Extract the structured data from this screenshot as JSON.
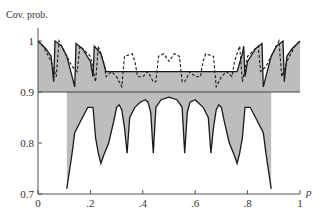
{
  "chart_data": {
    "type": "line",
    "title": "",
    "ylabel": "Cov. prob.",
    "xlabel": "p",
    "xlim": [
      0,
      1
    ],
    "ylim": [
      0.7,
      1.0
    ],
    "x_ticks": [
      {
        "value": 0,
        "label": "0"
      },
      {
        "value": 0.2,
        "label": ".2"
      },
      {
        "value": 0.4,
        "label": ".4"
      },
      {
        "value": 0.6,
        "label": ".6"
      },
      {
        "value": 0.8,
        "label": ".8"
      },
      {
        "value": 1.0,
        "label": "1"
      }
    ],
    "y_ticks": [
      {
        "value": 1.0,
        "label": "1"
      },
      {
        "value": 0.9,
        "label": "0.9"
      },
      {
        "value": 0.8,
        "label": "0.8"
      },
      {
        "value": 0.7,
        "label": "0.7"
      }
    ],
    "reference_line": 0.9,
    "grid": false,
    "legend": "none",
    "fill_color": "#bdbdbd",
    "line_color": "#1a1a1a",
    "series": [
      {
        "name": "dashed coverage curve",
        "style": "dashed",
        "points": [
          [
            0,
            1.0
          ],
          [
            0.02,
            0.99
          ],
          [
            0.05,
            0.96
          ],
          [
            0.07,
            0.93
          ],
          [
            0.08,
            1.0
          ],
          [
            0.1,
            0.98
          ],
          [
            0.13,
            0.95
          ],
          [
            0.15,
            0.94
          ],
          [
            0.16,
            0.99
          ],
          [
            0.2,
            0.97
          ],
          [
            0.22,
            0.92
          ],
          [
            0.23,
            0.99
          ],
          [
            0.25,
            0.96
          ],
          [
            0.26,
            0.93
          ],
          [
            0.28,
            0.94
          ],
          [
            0.3,
            0.93
          ],
          [
            0.32,
            0.91
          ],
          [
            0.33,
            0.97
          ],
          [
            0.36,
            0.975
          ],
          [
            0.37,
            0.96
          ],
          [
            0.38,
            0.93
          ],
          [
            0.4,
            0.93
          ],
          [
            0.42,
            0.94
          ],
          [
            0.44,
            0.92
          ],
          [
            0.45,
            0.92
          ],
          [
            0.46,
            0.97
          ],
          [
            0.48,
            0.975
          ],
          [
            0.5,
            0.96
          ],
          [
            0.52,
            0.975
          ],
          [
            0.54,
            0.97
          ],
          [
            0.55,
            0.92
          ],
          [
            0.56,
            0.92
          ],
          [
            0.58,
            0.94
          ],
          [
            0.6,
            0.93
          ],
          [
            0.62,
            0.93
          ],
          [
            0.63,
            0.96
          ],
          [
            0.64,
            0.975
          ],
          [
            0.67,
            0.97
          ],
          [
            0.68,
            0.91
          ],
          [
            0.7,
            0.93
          ],
          [
            0.72,
            0.94
          ],
          [
            0.74,
            0.93
          ],
          [
            0.75,
            0.96
          ],
          [
            0.77,
            0.99
          ],
          [
            0.78,
            0.92
          ],
          [
            0.8,
            0.97
          ],
          [
            0.84,
            0.99
          ],
          [
            0.85,
            0.94
          ],
          [
            0.87,
            0.95
          ],
          [
            0.9,
            0.98
          ],
          [
            0.92,
            1.0
          ],
          [
            0.93,
            0.93
          ],
          [
            0.95,
            0.96
          ],
          [
            0.98,
            0.99
          ],
          [
            1.0,
            1.0
          ]
        ]
      },
      {
        "name": "solid upper coverage curve",
        "style": "solid",
        "points": [
          [
            0,
            1.0
          ],
          [
            0.03,
            0.985
          ],
          [
            0.05,
            0.97
          ],
          [
            0.06,
            0.92
          ],
          [
            0.065,
            1.0
          ],
          [
            0.09,
            0.99
          ],
          [
            0.11,
            0.97
          ],
          [
            0.13,
            0.93
          ],
          [
            0.14,
            0.91
          ],
          [
            0.145,
            0.995
          ],
          [
            0.17,
            0.985
          ],
          [
            0.2,
            0.96
          ],
          [
            0.21,
            0.93
          ],
          [
            0.215,
            0.99
          ],
          [
            0.24,
            0.975
          ],
          [
            0.26,
            0.94
          ],
          [
            0.76,
            0.94
          ],
          [
            0.78,
            0.975
          ],
          [
            0.785,
            0.99
          ],
          [
            0.79,
            0.93
          ],
          [
            0.8,
            0.96
          ],
          [
            0.83,
            0.985
          ],
          [
            0.855,
            0.995
          ],
          [
            0.86,
            0.91
          ],
          [
            0.87,
            0.93
          ],
          [
            0.89,
            0.97
          ],
          [
            0.91,
            0.99
          ],
          [
            0.935,
            1.0
          ],
          [
            0.94,
            0.92
          ],
          [
            0.95,
            0.97
          ],
          [
            0.97,
            0.985
          ],
          [
            1.0,
            1.0
          ]
        ]
      },
      {
        "name": "solid lower coverage curve",
        "style": "solid",
        "points": [
          [
            0.11,
            0.71
          ],
          [
            0.13,
            0.78
          ],
          [
            0.14,
            0.82
          ],
          [
            0.17,
            0.85
          ],
          [
            0.19,
            0.87
          ],
          [
            0.21,
            0.87
          ],
          [
            0.22,
            0.81
          ],
          [
            0.23,
            0.78
          ],
          [
            0.24,
            0.76
          ],
          [
            0.25,
            0.775
          ],
          [
            0.27,
            0.8
          ],
          [
            0.29,
            0.845
          ],
          [
            0.3,
            0.87
          ],
          [
            0.31,
            0.875
          ],
          [
            0.32,
            0.865
          ],
          [
            0.33,
            0.83
          ],
          [
            0.34,
            0.78
          ],
          [
            0.35,
            0.85
          ],
          [
            0.37,
            0.87
          ],
          [
            0.39,
            0.88
          ],
          [
            0.41,
            0.885
          ],
          [
            0.42,
            0.88
          ],
          [
            0.43,
            0.86
          ],
          [
            0.44,
            0.78
          ],
          [
            0.45,
            0.87
          ],
          [
            0.47,
            0.885
          ],
          [
            0.5,
            0.89
          ],
          [
            0.53,
            0.885
          ],
          [
            0.55,
            0.87
          ],
          [
            0.56,
            0.78
          ],
          [
            0.57,
            0.86
          ],
          [
            0.58,
            0.88
          ],
          [
            0.6,
            0.885
          ],
          [
            0.61,
            0.88
          ],
          [
            0.63,
            0.87
          ],
          [
            0.65,
            0.85
          ],
          [
            0.66,
            0.78
          ],
          [
            0.67,
            0.83
          ],
          [
            0.68,
            0.865
          ],
          [
            0.69,
            0.875
          ],
          [
            0.7,
            0.87
          ],
          [
            0.71,
            0.845
          ],
          [
            0.73,
            0.8
          ],
          [
            0.75,
            0.775
          ],
          [
            0.76,
            0.76
          ],
          [
            0.77,
            0.78
          ],
          [
            0.78,
            0.81
          ],
          [
            0.79,
            0.87
          ],
          [
            0.81,
            0.87
          ],
          [
            0.83,
            0.85
          ],
          [
            0.86,
            0.82
          ],
          [
            0.87,
            0.78
          ],
          [
            0.89,
            0.71
          ]
        ]
      }
    ],
    "shaded_regions": [
      {
        "x_range": [
          0.0,
          0.2
        ],
        "side": "above",
        "description": "gray fill between curve and 0.9 line"
      },
      {
        "x_range": [
          0.1,
          0.23
        ],
        "side": "below",
        "description": "gray fill below 0.9 line down to lower curve"
      },
      {
        "x_range": [
          0.3,
          0.35
        ],
        "side": "both"
      },
      {
        "x_range": [
          0.4,
          0.45
        ],
        "side": "both"
      },
      {
        "x_range": [
          0.55,
          0.6
        ],
        "side": "both"
      },
      {
        "x_range": [
          0.65,
          0.7
        ],
        "side": "both"
      },
      {
        "x_range": [
          0.77,
          0.9
        ],
        "side": "below"
      },
      {
        "x_range": [
          0.8,
          1.0
        ],
        "side": "above"
      }
    ]
  }
}
